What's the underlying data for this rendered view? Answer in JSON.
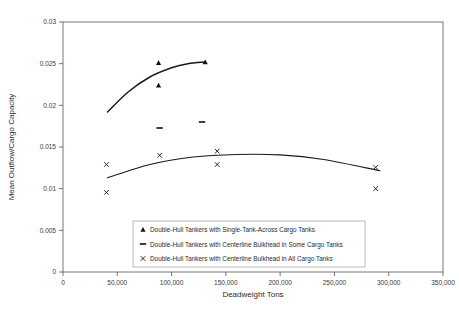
{
  "chart_data": {
    "type": "scatter",
    "title": "",
    "xlabel": "Deadweight Tons",
    "ylabel": "Mean Outflow/Cargo Capacity",
    "xlim": [
      0,
      350000
    ],
    "ylim": [
      0,
      0.03
    ],
    "grid": false,
    "legend_position": "inside-bottom-center",
    "xticks": [
      0,
      50000,
      100000,
      150000,
      200000,
      250000,
      300000,
      350000
    ],
    "xtick_labels": [
      "0",
      "50,000",
      "100,000",
      "150,000",
      "200,000",
      "250,000",
      "300,000",
      "350,000"
    ],
    "yticks": [
      0,
      0.005,
      0.01,
      0.015,
      0.02,
      0.025,
      0.03
    ],
    "ytick_labels": [
      "0",
      "0.005",
      "0.01",
      "0.015",
      "0.02",
      "0.025",
      "0.03"
    ],
    "series": [
      {
        "name": "Double-Hull Tankers with Single-Tank-Across Cargo Tanks",
        "marker": "triangle",
        "points": [
          {
            "x": 88000,
            "y": 0.0251
          },
          {
            "x": 88000,
            "y": 0.0224
          },
          {
            "x": 131000,
            "y": 0.0252
          }
        ],
        "trendline": [
          {
            "x": 41000,
            "y": 0.0192
          },
          {
            "x": 60000,
            "y": 0.0216
          },
          {
            "x": 80000,
            "y": 0.0234
          },
          {
            "x": 100000,
            "y": 0.0245
          },
          {
            "x": 115000,
            "y": 0.025
          },
          {
            "x": 131000,
            "y": 0.0252
          }
        ]
      },
      {
        "name": "Double-Hull Tankers with Centerline Bulkhead in Some Cargo Tanks",
        "marker": "dash",
        "points": [
          {
            "x": 89000,
            "y": 0.01728
          },
          {
            "x": 128000,
            "y": 0.018
          }
        ],
        "trendline": []
      },
      {
        "name": "Double-Hull Tankers with Centerline Bulkhead in All Cargo Tanks",
        "marker": "x",
        "points": [
          {
            "x": 40000,
            "y": 0.0129
          },
          {
            "x": 40000,
            "y": 0.00955
          },
          {
            "x": 89000,
            "y": 0.014
          },
          {
            "x": 142000,
            "y": 0.0145
          },
          {
            "x": 142000,
            "y": 0.0129
          },
          {
            "x": 288000,
            "y": 0.01255
          },
          {
            "x": 288000,
            "y": 0.01
          }
        ],
        "trendline": [
          {
            "x": 41000,
            "y": 0.0113
          },
          {
            "x": 80000,
            "y": 0.0129
          },
          {
            "x": 120000,
            "y": 0.0138
          },
          {
            "x": 160000,
            "y": 0.0141
          },
          {
            "x": 200000,
            "y": 0.01405
          },
          {
            "x": 240000,
            "y": 0.0135
          },
          {
            "x": 292000,
            "y": 0.01215
          }
        ]
      }
    ]
  },
  "legend": {
    "entries": [
      {
        "marker": "triangle",
        "label": "Double-Hull Tankers with Single-Tank-Across Cargo Tanks"
      },
      {
        "marker": "dash",
        "label": "Double-Hull Tankers with Centerline Bulkhead in Some Cargo Tanks"
      },
      {
        "marker": "x",
        "label": "Double-Hull Tankers with Centerline Bulkhead in All Cargo Tanks"
      }
    ]
  }
}
